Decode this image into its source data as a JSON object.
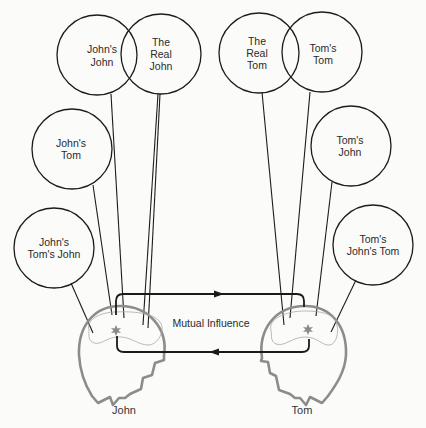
{
  "diagram": {
    "title": "",
    "persons": {
      "left": {
        "name": "John"
      },
      "right": {
        "name": "Tom"
      }
    },
    "center_label": "Mutual Influence",
    "left_circles": [
      {
        "id": "johns-john",
        "line1": "John's",
        "line2": "John",
        "line3": ""
      },
      {
        "id": "the-real-john",
        "line1": "The",
        "line2": "Real",
        "line3": "John"
      },
      {
        "id": "johns-tom",
        "line1": "John's",
        "line2": "Tom",
        "line3": ""
      },
      {
        "id": "johns-toms-john",
        "line1": "John's",
        "line2": "Tom's John",
        "line3": ""
      }
    ],
    "right_circles": [
      {
        "id": "the-real-tom",
        "line1": "The",
        "line2": "Real",
        "line3": "Tom"
      },
      {
        "id": "toms-tom",
        "line1": "Tom's",
        "line2": "Tom",
        "line3": ""
      },
      {
        "id": "toms-john",
        "line1": "Tom's",
        "line2": "John",
        "line3": ""
      },
      {
        "id": "toms-johns-tom",
        "line1": "Tom's",
        "line2": "John's Tom",
        "line3": ""
      }
    ],
    "arrows": [
      {
        "direction": "left-to-right",
        "position": "top"
      },
      {
        "direction": "right-to-left",
        "position": "bottom"
      }
    ],
    "colors": {
      "circle_stroke": "#1c1c1c",
      "head_outline": "#8c8c8c",
      "brain_outline": "#a8a8a8",
      "arrow": "#1a1a1a",
      "background": "#fbfbf9"
    }
  }
}
